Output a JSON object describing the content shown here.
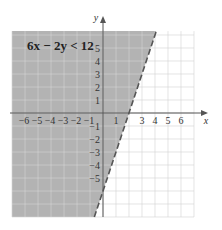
{
  "chart_data": {
    "type": "area",
    "title": "6x − 2y < 12",
    "boundary_line": {
      "equation": "6x - 2y = 12",
      "slope_intercept": "y = 3x - 6",
      "slope": 3,
      "intercept": -6,
      "style": "dashed",
      "points": [
        [
          -0.67,
          -8
        ],
        [
          4.1,
          6.3
        ]
      ]
    },
    "shaded_region": "left of / above line (6x - 2y < 12)",
    "xlabel": "x",
    "ylabel": "y",
    "xlim": [
      -7,
      7
    ],
    "ylim": [
      -8,
      6.3
    ],
    "x_ticks": [
      -6,
      -5,
      -4,
      -3,
      -2,
      -1,
      1,
      3,
      4,
      5,
      6
    ],
    "y_ticks": [
      5,
      4,
      3,
      2,
      1,
      -1,
      -2,
      -3,
      -4,
      -5
    ],
    "grid": true,
    "colors": {
      "shade": "#b3b3b3",
      "grid_shaded": "#c8c8c8",
      "grid_unshaded": "#d6d6d6",
      "axis": "#555555",
      "line": "#555555"
    }
  },
  "labels": {
    "inequality": "6x − 2y < 12",
    "x_axis": "x",
    "y_axis": "y"
  }
}
